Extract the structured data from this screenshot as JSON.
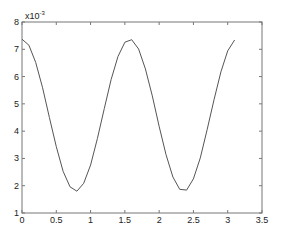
{
  "chart_data": {
    "type": "line",
    "title": "",
    "xlabel": "",
    "ylabel": "",
    "y_scale_label": "x10^-3",
    "y_multiplier": 0.001,
    "xlim": [
      0,
      3.5
    ],
    "ylim": [
      1,
      8
    ],
    "x_ticks": [
      "0",
      "0.5",
      "1",
      "1.5",
      "2",
      "2.5",
      "3",
      "3.5"
    ],
    "y_ticks": [
      "1",
      "2",
      "3",
      "4",
      "5",
      "6",
      "7",
      "8"
    ],
    "grid": false,
    "legend": null,
    "series": [
      {
        "name": "series-1",
        "color": "#555555",
        "x": [
          0.0,
          0.1,
          0.2,
          0.3,
          0.4,
          0.5,
          0.6,
          0.7,
          0.8,
          0.9,
          1.0,
          1.1,
          1.2,
          1.3,
          1.4,
          1.5,
          1.6,
          1.7,
          1.8,
          1.9,
          2.0,
          2.1,
          2.2,
          2.3,
          2.4,
          2.5,
          2.6,
          2.7,
          2.8,
          2.9,
          3.0,
          3.1
        ],
        "y": [
          7.37,
          7.15,
          6.52,
          5.59,
          4.5,
          3.43,
          2.53,
          1.96,
          1.8,
          2.09,
          2.76,
          3.73,
          4.83,
          5.89,
          6.74,
          7.26,
          7.35,
          7.01,
          6.28,
          5.29,
          4.18,
          3.14,
          2.32,
          1.87,
          1.84,
          2.25,
          3.02,
          4.05,
          5.15,
          6.17,
          6.94,
          7.34
        ]
      }
    ]
  },
  "labels": {
    "exp_base": "x10",
    "exp_power": "-3"
  }
}
